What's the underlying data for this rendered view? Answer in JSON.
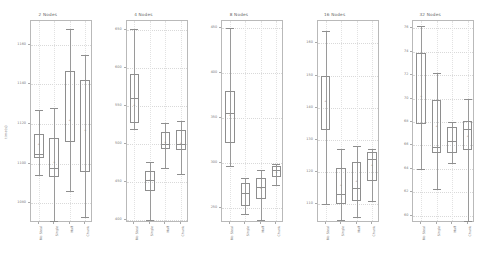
{
  "figure": {
    "ylabel": "time(s)",
    "categories": [
      "No Steal",
      "Single",
      "Half",
      "Chunk"
    ]
  },
  "chart_data": {
    "type": "box",
    "title": "",
    "xlabel": "",
    "ylabel": "time(s)",
    "grid": true,
    "legend": "none",
    "categories": [
      "No Steal",
      "Single",
      "Half",
      "Chunk"
    ],
    "panels": [
      {
        "title": "2 Nodes",
        "ylim": [
          1070,
          1172
        ],
        "yticks": [
          1080,
          1100,
          1120,
          1140,
          1160
        ],
        "ytick_labels": [
          "1080",
          "1100",
          "1120",
          "1140",
          "1160"
        ],
        "boxes": [
          {
            "category": "No Steal",
            "whisker_low": 1094.0,
            "q1": 1103.0,
            "median": 1105.0,
            "q3": 1115.0,
            "whisker_high": 1127.0,
            "mean": 1110.0
          },
          {
            "category": "Single",
            "whisker_low": 1071.0,
            "q1": 1093.0,
            "median": 1098.0,
            "q3": 1113.0,
            "whisker_high": 1128.0,
            "mean": 1101.0
          },
          {
            "category": "Half",
            "whisker_low": 1086.0,
            "q1": 1111.0,
            "median": 1147.0,
            "q3": 1147.0,
            "whisker_high": 1168.0,
            "mean": 1122.0
          },
          {
            "category": "Chunk",
            "whisker_low": 1073.0,
            "q1": 1096.0,
            "median": 1142.0,
            "q3": 1142.0,
            "whisker_high": 1155.0,
            "mean": 1117.0
          }
        ]
      },
      {
        "title": "4 Nodes",
        "ylim": [
          396,
          662
        ],
        "yticks": [
          400,
          450,
          500,
          550,
          600,
          650
        ],
        "ytick_labels": [
          "400",
          "450",
          "500",
          "550",
          "600",
          "650"
        ],
        "boxes": [
          {
            "category": "No Steal",
            "whisker_low": 520.0,
            "q1": 528.0,
            "median": 560.0,
            "q3": 592.0,
            "whisker_high": 651.0,
            "mean": 551.0
          },
          {
            "category": "Single",
            "whisker_low": 400.0,
            "q1": 438.0,
            "median": 452.0,
            "q3": 464.0,
            "whisker_high": 476.0,
            "mean": 452.0
          },
          {
            "category": "Half",
            "whisker_low": 468.0,
            "q1": 493.0,
            "median": 500.0,
            "q3": 516.0,
            "whisker_high": 528.0,
            "mean": 503.0
          },
          {
            "category": "Chunk",
            "whisker_low": 460.0,
            "q1": 492.0,
            "median": 500.0,
            "q3": 518.0,
            "whisker_high": 530.0,
            "mean": 502.0
          }
        ]
      },
      {
        "title": "8 Nodes",
        "ylim": [
          233,
          458
        ],
        "yticks": [
          250,
          300,
          350,
          400,
          450
        ],
        "ytick_labels": [
          "250",
          "300",
          "350",
          "400",
          "450"
        ],
        "boxes": [
          {
            "category": "No Steal",
            "whisker_low": 296.0,
            "q1": 322.0,
            "median": 355.0,
            "q3": 380.0,
            "whisker_high": 450.0,
            "mean": 353.0
          },
          {
            "category": "Single",
            "whisker_low": 243.0,
            "q1": 252.0,
            "median": 266.0,
            "q3": 277.0,
            "whisker_high": 283.0,
            "mean": 266.0
          },
          {
            "category": "Half",
            "whisker_low": 236.0,
            "q1": 260.0,
            "median": 273.0,
            "q3": 283.0,
            "whisker_high": 292.0,
            "mean": 272.0
          },
          {
            "category": "Chunk",
            "whisker_low": 275.0,
            "q1": 284.0,
            "median": 292.0,
            "q3": 297.0,
            "whisker_high": 299.0,
            "mean": 290.0
          }
        ]
      },
      {
        "title": "16 Nodes",
        "ylim": [
          104,
          167
        ],
        "yticks": [
          110,
          120,
          130,
          140,
          150,
          160
        ],
        "ytick_labels": [
          "110",
          "120",
          "130",
          "140",
          "150",
          "160"
        ],
        "boxes": [
          {
            "category": "No Steal",
            "whisker_low": 110.0,
            "q1": 133.0,
            "median": 150.0,
            "q3": 150.0,
            "whisker_high": 164.0,
            "mean": 142.0
          },
          {
            "category": "Single",
            "whisker_low": 105.0,
            "q1": 110.0,
            "median": 113.0,
            "q3": 121.0,
            "whisker_high": 127.0,
            "mean": 116.0
          },
          {
            "category": "Half",
            "whisker_low": 106.0,
            "q1": 111.0,
            "median": 115.0,
            "q3": 123.0,
            "whisker_high": 128.0,
            "mean": 117.0
          },
          {
            "category": "Chunk",
            "whisker_low": 111.0,
            "q1": 117.0,
            "median": 124.0,
            "q3": 126.0,
            "whisker_high": 127.0,
            "mean": 122.0
          }
        ]
      },
      {
        "title": "32 Nodes",
        "ylim": [
          59.4,
          76.6
        ],
        "yticks": [
          60,
          62,
          64,
          66,
          68,
          70,
          72,
          74,
          76
        ],
        "ytick_labels": [
          "60",
          "62",
          "64",
          "66",
          "68",
          "70",
          "72",
          "74",
          "76"
        ],
        "boxes": [
          {
            "category": "No Steal",
            "whisker_low": 64.0,
            "q1": 67.8,
            "median": 73.9,
            "q3": 73.9,
            "whisker_high": 76.2,
            "mean": 70.2
          },
          {
            "category": "Single",
            "whisker_low": 62.3,
            "q1": 65.4,
            "median": 65.9,
            "q3": 69.9,
            "whisker_high": 72.2,
            "mean": 67.7
          },
          {
            "category": "Half",
            "whisker_low": 64.5,
            "q1": 65.4,
            "median": 66.4,
            "q3": 67.6,
            "whisker_high": 68.0,
            "mean": 66.4
          },
          {
            "category": "Chunk",
            "whisker_low": 59.6,
            "q1": 65.6,
            "median": 67.4,
            "q3": 68.1,
            "whisker_high": 70.0,
            "mean": 66.8
          }
        ]
      }
    ]
  }
}
